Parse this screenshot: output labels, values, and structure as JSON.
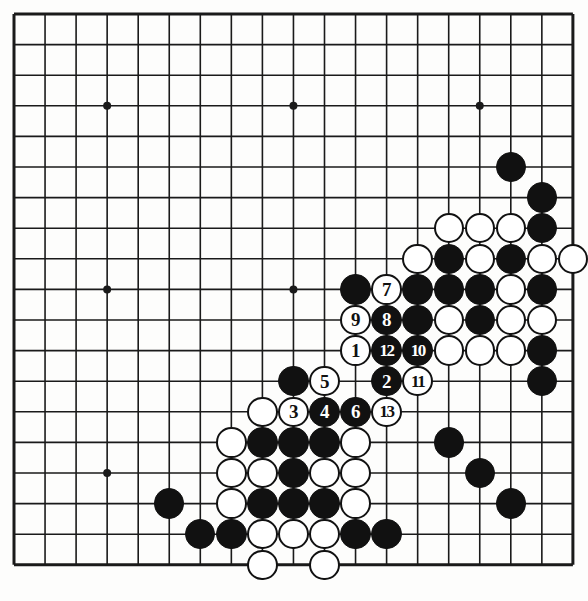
{
  "diagram": {
    "type": "go-board-diagram",
    "board_size": 19,
    "colors": {
      "line": "#1a1a1a",
      "black_stone": "#111111",
      "white_stone": "#ffffff",
      "background": "#fdfdfc"
    },
    "geometry": {
      "origin_x": 14,
      "origin_y": 14,
      "step_x": 31.05,
      "step_y": 30.6,
      "stone_radius": 15.2,
      "line_width": 1.6,
      "border_width": 3
    },
    "star_points": [
      {
        "col": 4,
        "row": 4
      },
      {
        "col": 10,
        "row": 4
      },
      {
        "col": 16,
        "row": 4
      },
      {
        "col": 4,
        "row": 10
      },
      {
        "col": 10,
        "row": 10
      },
      {
        "col": 16,
        "row": 10
      },
      {
        "col": 4,
        "row": 16
      },
      {
        "col": 10,
        "row": 16
      },
      {
        "col": 16,
        "row": 16
      }
    ],
    "stones": [
      {
        "col": 17,
        "row": 6,
        "color": "black",
        "label": ""
      },
      {
        "col": 18,
        "row": 7,
        "color": "black",
        "label": ""
      },
      {
        "col": 15,
        "row": 8,
        "color": "white",
        "label": ""
      },
      {
        "col": 16,
        "row": 8,
        "color": "white",
        "label": ""
      },
      {
        "col": 17,
        "row": 8,
        "color": "white",
        "label": ""
      },
      {
        "col": 18,
        "row": 8,
        "color": "black",
        "label": ""
      },
      {
        "col": 14,
        "row": 9,
        "color": "white",
        "label": ""
      },
      {
        "col": 15,
        "row": 9,
        "color": "black",
        "label": ""
      },
      {
        "col": 16,
        "row": 9,
        "color": "white",
        "label": ""
      },
      {
        "col": 17,
        "row": 9,
        "color": "black",
        "label": ""
      },
      {
        "col": 18,
        "row": 9,
        "color": "white",
        "label": ""
      },
      {
        "col": 19,
        "row": 9,
        "color": "white",
        "label": ""
      },
      {
        "col": 12,
        "row": 10,
        "color": "black",
        "label": ""
      },
      {
        "col": 13,
        "row": 10,
        "color": "white",
        "label": "7"
      },
      {
        "col": 14,
        "row": 10,
        "color": "black",
        "label": ""
      },
      {
        "col": 15,
        "row": 10,
        "color": "black",
        "label": ""
      },
      {
        "col": 16,
        "row": 10,
        "color": "black",
        "label": ""
      },
      {
        "col": 17,
        "row": 10,
        "color": "white",
        "label": ""
      },
      {
        "col": 18,
        "row": 10,
        "color": "black",
        "label": ""
      },
      {
        "col": 12,
        "row": 11,
        "color": "white",
        "label": "9"
      },
      {
        "col": 13,
        "row": 11,
        "color": "black",
        "label": "8"
      },
      {
        "col": 14,
        "row": 11,
        "color": "black",
        "label": ""
      },
      {
        "col": 15,
        "row": 11,
        "color": "white",
        "label": ""
      },
      {
        "col": 16,
        "row": 11,
        "color": "black",
        "label": ""
      },
      {
        "col": 17,
        "row": 11,
        "color": "white",
        "label": ""
      },
      {
        "col": 18,
        "row": 11,
        "color": "white",
        "label": ""
      },
      {
        "col": 12,
        "row": 12,
        "color": "white",
        "label": "1"
      },
      {
        "col": 13,
        "row": 12,
        "color": "black",
        "label": "12"
      },
      {
        "col": 14,
        "row": 12,
        "color": "black",
        "label": "10"
      },
      {
        "col": 15,
        "row": 12,
        "color": "white",
        "label": ""
      },
      {
        "col": 16,
        "row": 12,
        "color": "white",
        "label": ""
      },
      {
        "col": 17,
        "row": 12,
        "color": "white",
        "label": ""
      },
      {
        "col": 18,
        "row": 12,
        "color": "black",
        "label": ""
      },
      {
        "col": 10,
        "row": 13,
        "color": "black",
        "label": ""
      },
      {
        "col": 11,
        "row": 13,
        "color": "white",
        "label": "5"
      },
      {
        "col": 13,
        "row": 13,
        "color": "black",
        "label": "2"
      },
      {
        "col": 14,
        "row": 13,
        "color": "white",
        "label": "11"
      },
      {
        "col": 18,
        "row": 13,
        "color": "black",
        "label": ""
      },
      {
        "col": 9,
        "row": 14,
        "color": "white",
        "label": ""
      },
      {
        "col": 10,
        "row": 14,
        "color": "white",
        "label": "3"
      },
      {
        "col": 11,
        "row": 14,
        "color": "black",
        "label": "4"
      },
      {
        "col": 12,
        "row": 14,
        "color": "black",
        "label": "6"
      },
      {
        "col": 13,
        "row": 14,
        "color": "white",
        "label": "13"
      },
      {
        "col": 8,
        "row": 15,
        "color": "white",
        "label": ""
      },
      {
        "col": 9,
        "row": 15,
        "color": "black",
        "label": ""
      },
      {
        "col": 10,
        "row": 15,
        "color": "black",
        "label": ""
      },
      {
        "col": 11,
        "row": 15,
        "color": "black",
        "label": ""
      },
      {
        "col": 12,
        "row": 15,
        "color": "white",
        "label": ""
      },
      {
        "col": 15,
        "row": 15,
        "color": "black",
        "label": ""
      },
      {
        "col": 8,
        "row": 16,
        "color": "white",
        "label": ""
      },
      {
        "col": 9,
        "row": 16,
        "color": "white",
        "label": ""
      },
      {
        "col": 10,
        "row": 16,
        "color": "black",
        "label": ""
      },
      {
        "col": 11,
        "row": 16,
        "color": "white",
        "label": ""
      },
      {
        "col": 12,
        "row": 16,
        "color": "white",
        "label": ""
      },
      {
        "col": 16,
        "row": 16,
        "color": "black",
        "label": ""
      },
      {
        "col": 6,
        "row": 17,
        "color": "black",
        "label": ""
      },
      {
        "col": 8,
        "row": 17,
        "color": "white",
        "label": ""
      },
      {
        "col": 9,
        "row": 17,
        "color": "black",
        "label": ""
      },
      {
        "col": 10,
        "row": 17,
        "color": "black",
        "label": ""
      },
      {
        "col": 11,
        "row": 17,
        "color": "black",
        "label": ""
      },
      {
        "col": 12,
        "row": 17,
        "color": "white",
        "label": ""
      },
      {
        "col": 17,
        "row": 17,
        "color": "black",
        "label": ""
      },
      {
        "col": 7,
        "row": 18,
        "color": "black",
        "label": ""
      },
      {
        "col": 8,
        "row": 18,
        "color": "black",
        "label": ""
      },
      {
        "col": 9,
        "row": 18,
        "color": "white",
        "label": ""
      },
      {
        "col": 10,
        "row": 18,
        "color": "white",
        "label": ""
      },
      {
        "col": 11,
        "row": 18,
        "color": "white",
        "label": ""
      },
      {
        "col": 12,
        "row": 18,
        "color": "black",
        "label": ""
      },
      {
        "col": 13,
        "row": 18,
        "color": "black",
        "label": ""
      },
      {
        "col": 9,
        "row": 19,
        "color": "white",
        "label": ""
      },
      {
        "col": 11,
        "row": 19,
        "color": "white",
        "label": ""
      }
    ]
  }
}
